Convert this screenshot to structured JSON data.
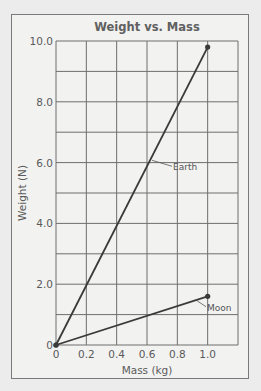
{
  "chart_data": {
    "type": "line",
    "title": "Weight vs. Mass",
    "xlabel": "Mass (kg)",
    "ylabel": "Weight (N)",
    "xlim": [
      0,
      1.2
    ],
    "ylim": [
      0,
      10.0
    ],
    "grid": true,
    "x_ticks": [
      "0",
      "0.2",
      "0.4",
      "0.6",
      "0.8",
      "1.0"
    ],
    "y_ticks": [
      "0",
      "2.0",
      "4.0",
      "6.0",
      "8.0",
      "10.0"
    ],
    "series": [
      {
        "name": "Earth",
        "x": [
          0,
          1.0
        ],
        "y": [
          0,
          9.8
        ]
      },
      {
        "name": "Moon",
        "x": [
          0,
          1.0
        ],
        "y": [
          0,
          1.6
        ]
      }
    ],
    "annotations": [
      {
        "text": "Earth",
        "points_to_series": "Earth",
        "at_x": 0.66
      },
      {
        "text": "Moon",
        "points_to_series": "Moon",
        "at_x": 1.05
      }
    ],
    "legend": "none (inline labels)"
  },
  "colors": {
    "line": "#3a3a3a",
    "grid": "#6e6e6e",
    "background": "#f2f2f1",
    "text": "#5a5a5a"
  }
}
